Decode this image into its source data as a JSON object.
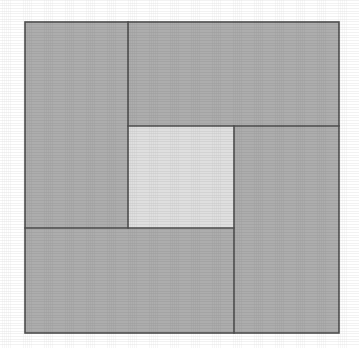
{
  "figure": {
    "background_color": "#ffffff",
    "stroke_color": "#4f4f4f",
    "stroke_width": 1.6,
    "outer_square": {
      "label": "outer-square",
      "x": 25,
      "y": 22,
      "width": 314,
      "height": 311,
      "fill": "#adadad"
    },
    "inner_square": {
      "label": "inner-square",
      "x": 128,
      "y": 126,
      "width": 106,
      "height": 102,
      "fill": "#dfdfdf"
    },
    "rectangles": [
      {
        "label": "left-rectangle",
        "position": "left",
        "x": 25,
        "y": 22,
        "width": 103,
        "height": 206,
        "fill": "#adadad"
      },
      {
        "label": "top-rectangle",
        "position": "top",
        "x": 128,
        "y": 22,
        "width": 211,
        "height": 104,
        "fill": "#adadad"
      },
      {
        "label": "right-rectangle",
        "position": "right",
        "x": 234,
        "y": 126,
        "width": 105,
        "height": 207,
        "fill": "#adadad"
      },
      {
        "label": "bottom-rectangle",
        "position": "bottom",
        "x": 25,
        "y": 228,
        "width": 209,
        "height": 105,
        "fill": "#adadad"
      }
    ],
    "dividers": [
      {
        "label": "divider-left-vertical",
        "x1": 128,
        "y1": 22,
        "x2": 128,
        "y2": 228
      },
      {
        "label": "divider-top-horizontal",
        "x1": 128,
        "y1": 126,
        "x2": 339,
        "y2": 126
      },
      {
        "label": "divider-right-vertical",
        "x1": 234,
        "y1": 126,
        "x2": 234,
        "y2": 333
      },
      {
        "label": "divider-bottom-horizontal",
        "x1": 25,
        "y1": 228,
        "x2": 234,
        "y2": 228
      }
    ]
  }
}
